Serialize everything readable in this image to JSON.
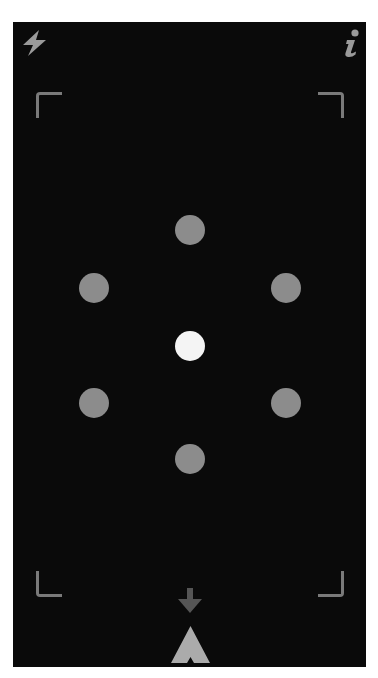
{
  "toolbar": {
    "flash_icon": "lightning-bolt",
    "info_icon": "info-i"
  },
  "viewfinder": {
    "corners": [
      "top-left",
      "top-right",
      "bottom-left",
      "bottom-right"
    ]
  },
  "pattern": {
    "dots": [
      {
        "id": "top",
        "cx": 190,
        "cy": 230,
        "active": false
      },
      {
        "id": "upper-left",
        "cx": 94,
        "cy": 288,
        "active": false
      },
      {
        "id": "upper-right",
        "cx": 286,
        "cy": 288,
        "active": false
      },
      {
        "id": "center",
        "cx": 190,
        "cy": 346,
        "active": true
      },
      {
        "id": "lower-left",
        "cx": 94,
        "cy": 403,
        "active": false
      },
      {
        "id": "lower-right",
        "cx": 286,
        "cy": 403,
        "active": false
      },
      {
        "id": "bottom",
        "cx": 190,
        "cy": 459,
        "active": false
      }
    ]
  },
  "bottom_controls": {
    "down_arrow_icon": "arrow-down",
    "shutter_icon": "chevron-up-arrowhead"
  },
  "colors": {
    "background": "#0a0a0a",
    "icon": "#9a9a9a",
    "bracket": "#7a7a7a",
    "dot": "#8c8c8c",
    "dot_active": "#f4f4f4",
    "down_arrow": "#555555",
    "shutter": "#ababab"
  }
}
